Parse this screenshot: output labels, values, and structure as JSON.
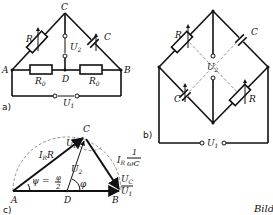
{
  "figure": {
    "caption_fragment": "Bild",
    "panels": {
      "a": {
        "label": "a)",
        "nodes": [
          "A",
          "B",
          "C",
          "D"
        ],
        "components": {
          "variable_resistor": "R",
          "variable_capacitor": "C",
          "fixed_resistor_left": "R0",
          "fixed_resistor_right": "R0"
        },
        "voltages": {
          "input": "U1",
          "output": "U2"
        }
      },
      "b": {
        "label": "b)",
        "components": {
          "top_left_resistor": "R",
          "top_right_capacitor": "C",
          "bottom_left_capacitor": "C",
          "bottom_right_resistor": "R"
        },
        "voltages": {
          "input": "U1",
          "output": "U2"
        }
      },
      "c": {
        "label": "c)",
        "points": [
          "A",
          "B",
          "C",
          "D"
        ],
        "vectors": {
          "AC": "I_R R",
          "CB": "I_R · 1/(ωC)",
          "DC": "U2",
          "AB": "U1",
          "CB_voltage": "UC",
          "AC_voltage": "UR"
        },
        "angles": {
          "psi": "ψ = φ/2",
          "phi": "φ"
        }
      }
    }
  },
  "text": {
    "A": "A",
    "B": "B",
    "C": "C",
    "D": "D",
    "R": "R",
    "Cc": "C",
    "R0": "R",
    "R0sub": "0",
    "U": "U",
    "sub1": "1",
    "sub2": "2",
    "subR": "R",
    "subC": "C",
    "I": "I",
    "phi": "φ",
    "psi": "ψ = ",
    "phi2num": "φ",
    "phi2den": "2",
    "one": "1",
    "omegaC": "ωC",
    "lblA": "a)",
    "lblB": "b)",
    "lblC": "c)",
    "caption": "Bild"
  }
}
